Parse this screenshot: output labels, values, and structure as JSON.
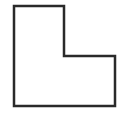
{
  "diagram": {
    "shape": "L-shape outline",
    "stroke_color": "#2a2a2a",
    "fill_color": "#ffffff",
    "background": "#ffffff",
    "stroke_width": 2.5,
    "points": [
      [
        14,
        6
      ],
      [
        64,
        6
      ],
      [
        64,
        56
      ],
      [
        115,
        56
      ],
      [
        115,
        106
      ],
      [
        14,
        106
      ]
    ]
  }
}
